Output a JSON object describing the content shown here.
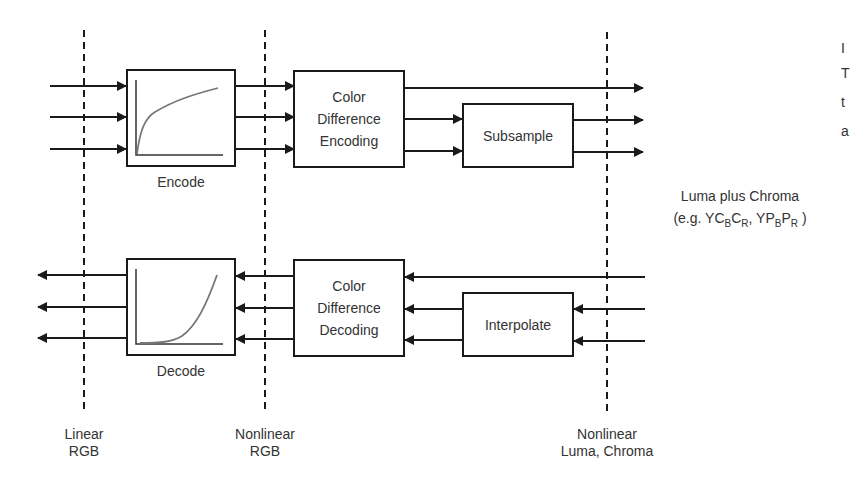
{
  "diagram": {
    "boundaries": [
      {
        "id": "linear-rgb",
        "line1": "Linear",
        "line2": "RGB"
      },
      {
        "id": "nonlinear-rgb",
        "line1": "Nonlinear",
        "line2": "RGB"
      },
      {
        "id": "nonlinear-luma-chroma",
        "line1": "Nonlinear",
        "line2": "Luma, Chroma"
      }
    ],
    "encode_path": {
      "encode_label": "Encode",
      "cde": {
        "line1": "Color",
        "line2": "Difference",
        "line3": "Encoding"
      },
      "subsample": "Subsample"
    },
    "decode_path": {
      "decode_label": "Decode",
      "cdd": {
        "line1": "Color",
        "line2": "Difference",
        "line3": "Decoding"
      },
      "interpolate": "Interpolate"
    },
    "output_label": {
      "line1": "Luma plus Chroma",
      "prefix": "(e.g. YC",
      "s1": "B",
      "m1": "C",
      "s2": "R",
      "m2": ", YP",
      "s3": "B",
      "m3": "P",
      "s4": "R",
      "suffix": " )"
    },
    "clipped_edge_text": [
      "I",
      "T",
      "t",
      "a"
    ],
    "colors": {
      "stroke": "#1a1a1a",
      "curve": "#777777",
      "text": "#333333",
      "background": "#ffffff"
    }
  }
}
